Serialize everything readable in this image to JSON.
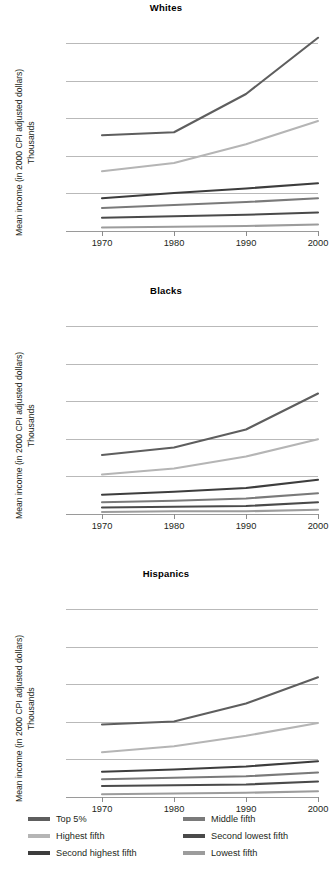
{
  "axis": {
    "ylabel_line1": "Mean income (in 2000 CPI adjusted dollars)",
    "ylabel_line2": "Thousands",
    "yticks": [
      "0",
      "50",
      "100",
      "150",
      "200",
      "250"
    ],
    "xticks": [
      "1970",
      "1980",
      "1990",
      "2000"
    ]
  },
  "legend": {
    "items": [
      {
        "label": "Top 5%",
        "color": "#5e5e5e"
      },
      {
        "label": "Middle fifth",
        "color": "#7a7a7a"
      },
      {
        "label": "Highest fifth",
        "color": "#b5b5b5"
      },
      {
        "label": "Second lowest fifth",
        "color": "#4a4a4a"
      },
      {
        "label": "Second highest fifth",
        "color": "#3d3d3d"
      },
      {
        "label": "Lowest fifth",
        "color": "#9c9c9c"
      }
    ]
  },
  "chart_data": [
    {
      "type": "line",
      "title": "Whites",
      "xlabel": "",
      "ylabel": "Mean income (in 2000 CPI adjusted dollars) Thousands",
      "x": [
        1970,
        1980,
        1990,
        2000
      ],
      "xlim": [
        1965,
        2000
      ],
      "ylim": [
        -10,
        262
      ],
      "yticks": [
        0,
        50,
        100,
        150,
        200,
        250
      ],
      "grid": true,
      "legend_position": "bottom",
      "series": [
        {
          "name": "Top 5%",
          "color": "#5e5e5e",
          "values": [
            127,
            131,
            182,
            257
          ]
        },
        {
          "name": "Highest fifth",
          "color": "#b5b5b5",
          "values": [
            79,
            90,
            115,
            146
          ]
        },
        {
          "name": "Second highest fifth",
          "color": "#3d3d3d",
          "values": [
            43,
            50,
            56,
            63
          ]
        },
        {
          "name": "Middle fifth",
          "color": "#7a7a7a",
          "values": [
            30,
            34,
            38,
            43
          ]
        },
        {
          "name": "Second lowest fifth",
          "color": "#4a4a4a",
          "values": [
            17,
            19,
            21,
            24
          ]
        },
        {
          "name": "Lowest fifth",
          "color": "#9c9c9c",
          "values": [
            4,
            5,
            6,
            8
          ]
        }
      ]
    },
    {
      "type": "line",
      "title": "Blacks",
      "xlabel": "",
      "ylabel": "Mean income (in 2000 CPI adjusted dollars) Thousands",
      "x": [
        1970,
        1980,
        1990,
        2000
      ],
      "xlim": [
        1965,
        2000
      ],
      "ylim": [
        -10,
        262
      ],
      "yticks": [
        0,
        50,
        100,
        150,
        200,
        250
      ],
      "grid": true,
      "legend_position": "bottom",
      "series": [
        {
          "name": "Top 5%",
          "color": "#5e5e5e",
          "values": [
            78,
            88,
            112,
            160
          ]
        },
        {
          "name": "Highest fifth",
          "color": "#b5b5b5",
          "values": [
            52,
            60,
            76,
            99
          ]
        },
        {
          "name": "Second highest fifth",
          "color": "#3d3d3d",
          "values": [
            25,
            29,
            34,
            45
          ]
        },
        {
          "name": "Middle fifth",
          "color": "#7a7a7a",
          "values": [
            15,
            17,
            20,
            27
          ]
        },
        {
          "name": "Second lowest fifth",
          "color": "#4a4a4a",
          "values": [
            8,
            9,
            10,
            15
          ]
        },
        {
          "name": "Lowest fifth",
          "color": "#9c9c9c",
          "values": [
            2,
            3,
            3,
            5
          ]
        }
      ]
    },
    {
      "type": "line",
      "title": "Hispanics",
      "xlabel": "",
      "ylabel": "Mean income (in 2000 CPI adjusted dollars) Thousands",
      "x": [
        1970,
        1980,
        1990,
        2000
      ],
      "xlim": [
        1965,
        2000
      ],
      "ylim": [
        -10,
        262
      ],
      "yticks": [
        0,
        50,
        100,
        150,
        200,
        250
      ],
      "grid": true,
      "legend_position": "bottom",
      "series": [
        {
          "name": "Top 5%",
          "color": "#5e5e5e",
          "values": [
            96,
            100,
            124,
            159
          ]
        },
        {
          "name": "Highest fifth",
          "color": "#b5b5b5",
          "values": [
            59,
            67,
            81,
            98
          ]
        },
        {
          "name": "Second highest fifth",
          "color": "#3d3d3d",
          "values": [
            33,
            36,
            40,
            47
          ]
        },
        {
          "name": "Middle fifth",
          "color": "#7a7a7a",
          "values": [
            23,
            25,
            27,
            32
          ]
        },
        {
          "name": "Second lowest fifth",
          "color": "#4a4a4a",
          "values": [
            14,
            15,
            16,
            20
          ]
        },
        {
          "name": "Lowest fifth",
          "color": "#9c9c9c",
          "values": [
            3,
            4,
            5,
            7
          ]
        }
      ]
    }
  ]
}
